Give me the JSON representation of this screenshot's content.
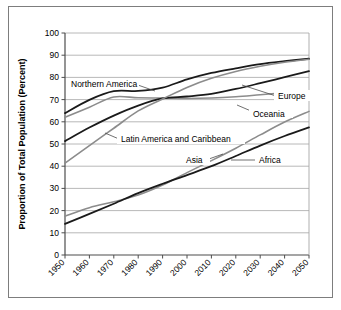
{
  "chart_data": {
    "type": "line",
    "title": "",
    "xlabel": "",
    "ylabel": "Proportion of Total Population (Percent)",
    "xlim": [
      1950,
      2050
    ],
    "ylim": [
      0,
      100
    ],
    "ytick_step": 10,
    "grid": true,
    "legend_position": "inline-annotations",
    "xticks": [
      "1950",
      "1960",
      "1970",
      "1980",
      "1990",
      "2000",
      "2010",
      "2020",
      "2030",
      "2040",
      "2050"
    ],
    "yticks": [
      "0",
      "10",
      "20",
      "30",
      "40",
      "50",
      "60",
      "70",
      "80",
      "90",
      "100"
    ],
    "x": [
      1950,
      1960,
      1970,
      1980,
      1990,
      2000,
      2010,
      2020,
      2030,
      2040,
      2050
    ],
    "series": [
      {
        "name": "Northern America",
        "color": "#1a1a1a",
        "width": 1.8,
        "values": [
          63.9,
          69.9,
          73.8,
          73.9,
          75.4,
          79.1,
          82.0,
          84.1,
          86.0,
          87.3,
          88.4
        ]
      },
      {
        "name": "Oceania",
        "color": "#8c8c8c",
        "width": 1.6,
        "values": [
          62.0,
          66.6,
          71.2,
          70.8,
          70.7,
          70.5,
          70.7,
          71.3,
          72.2,
          73.1,
          74.0
        ]
      },
      {
        "name": "Europe",
        "color": "#1a1a1a",
        "width": 1.8,
        "values": [
          51.3,
          57.4,
          62.8,
          67.3,
          70.5,
          71.4,
          72.6,
          74.8,
          77.4,
          80.1,
          82.8
        ]
      },
      {
        "name": "Latin America and Caribbean",
        "color": "#8c8c8c",
        "width": 1.6,
        "values": [
          41.4,
          49.3,
          57.1,
          64.9,
          70.3,
          75.5,
          79.6,
          82.7,
          85.0,
          86.8,
          88.2
        ]
      },
      {
        "name": "Asia",
        "color": "#8c8c8c",
        "width": 1.6,
        "values": [
          17.5,
          21.3,
          24.0,
          27.0,
          31.5,
          37.1,
          42.5,
          48.1,
          54.1,
          59.9,
          64.7
        ]
      },
      {
        "name": "Africa",
        "color": "#1a1a1a",
        "width": 1.8,
        "values": [
          14.0,
          18.5,
          23.1,
          27.9,
          32.1,
          36.0,
          40.0,
          44.6,
          49.3,
          53.6,
          57.5
        ]
      }
    ],
    "annotations": [
      {
        "name": "Northern America",
        "label": "Northern America"
      },
      {
        "name": "Europe",
        "label": "Europe"
      },
      {
        "name": "Oceania",
        "label": "Oceania"
      },
      {
        "name": "Latin America and Caribbean",
        "label": "Latin America and Caribbean"
      },
      {
        "name": "Asia",
        "label": "Asia"
      },
      {
        "name": "Africa",
        "label": "Africa"
      }
    ],
    "colors": {
      "dark_series": "#1a1a1a",
      "light_series": "#8c8c8c",
      "gridline": "#a6a6a6",
      "axis": "#4d4d4d",
      "frame": "#7d7d7d",
      "background": "#ffffff"
    }
  }
}
